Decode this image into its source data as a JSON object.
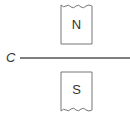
{
  "diagram": {
    "type": "magnetic field wire diagram",
    "wire": {
      "label": "C"
    },
    "poles": [
      {
        "label": "N",
        "position": "top"
      },
      {
        "label": "S",
        "position": "bottom"
      }
    ],
    "colors": {
      "stroke": "#555555",
      "text": "#333333",
      "background": "#ffffff"
    }
  }
}
